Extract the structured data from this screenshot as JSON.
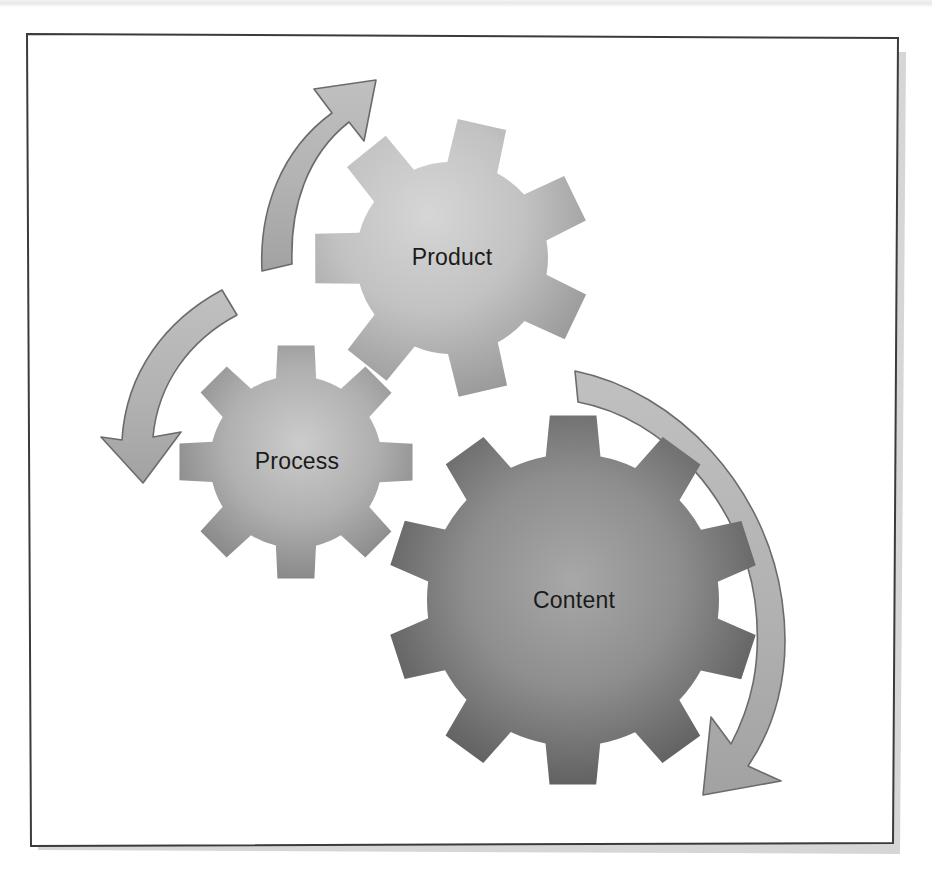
{
  "figure": {
    "frame": {
      "border_color": "#3b3b3b",
      "fill_color": "#ffffff",
      "shadow_color": "#9a9a9a"
    },
    "background_color": "#ffffff"
  },
  "gears": [
    {
      "id": "product",
      "label": "Product",
      "teeth": 7,
      "center_x": 452,
      "center_y": 258,
      "body_radius": 96,
      "tooth_radius": 139,
      "fill_light": "#cfcfcf",
      "fill_dark": "#8d8d8d",
      "label_color": "#1b1b1b"
    },
    {
      "id": "process",
      "label": "Process",
      "teeth": 8,
      "center_x": 296,
      "center_y": 462,
      "body_radius": 86,
      "tooth_radius": 118,
      "fill_light": "#c6c6c6",
      "fill_dark": "#6f6f6f",
      "label_color": "#1b1b1b"
    },
    {
      "id": "content",
      "label": "Content",
      "teeth": 10,
      "center_x": 573,
      "center_y": 600,
      "body_radius": 146,
      "tooth_radius": 186,
      "fill_light": "#9e9e9e",
      "fill_dark": "#454545",
      "label_color": "#111111"
    }
  ],
  "arrows": [
    {
      "id": "process-to-product",
      "from": "Process",
      "to": "Product",
      "direction": "up-right",
      "fill": "#b3b3b3",
      "stroke": "#6b6b6b"
    },
    {
      "id": "product-to-process",
      "from": "Product",
      "to": "Process",
      "direction": "down-left",
      "fill": "#b3b3b3",
      "stroke": "#6b6b6b"
    },
    {
      "id": "content-cycle",
      "from": "Content",
      "to": "Content",
      "direction": "clockwise-down",
      "fill": "#b3b3b3",
      "stroke": "#6b6b6b"
    }
  ],
  "chart_data": {
    "type": "diagram",
    "title": "",
    "nodes": [
      {
        "name": "Product",
        "size_rank": 2,
        "shade": "light-gray"
      },
      {
        "name": "Process",
        "size_rank": 3,
        "shade": "medium-gray"
      },
      {
        "name": "Content",
        "size_rank": 1,
        "shade": "dark-gray"
      }
    ],
    "edges": [
      {
        "from": "Process",
        "to": "Product",
        "style": "curved-arrow"
      },
      {
        "from": "Product",
        "to": "Process",
        "style": "curved-arrow"
      },
      {
        "from": "Content",
        "to": "Content",
        "style": "curved-arrow"
      }
    ],
    "legend": [],
    "annotations": []
  }
}
